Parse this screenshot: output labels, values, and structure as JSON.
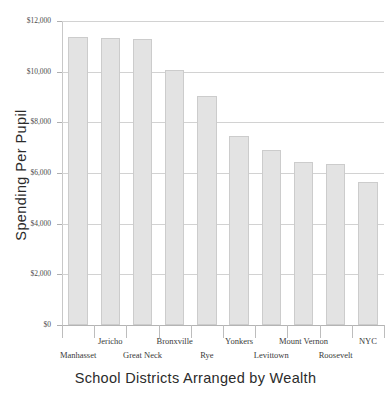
{
  "chart_data": {
    "type": "bar",
    "title": "",
    "xlabel": "School Districts Arranged by Wealth",
    "ylabel": "Spending Per Pupil",
    "categories": [
      "Manhasset",
      "Jericho",
      "Great Neck",
      "Bronxville",
      "Rye",
      "Yonkers",
      "Levittown",
      "Mount Vernon",
      "Roosevelt",
      "NYC"
    ],
    "values": [
      11350,
      11330,
      11300,
      10050,
      9050,
      7450,
      6900,
      6450,
      6350,
      5650
    ],
    "ylim": [
      0,
      12000
    ],
    "ytick_values": [
      0,
      2000,
      4000,
      6000,
      8000,
      10000,
      12000
    ],
    "ytick_labels": [
      "$0",
      "$2,000",
      "$4,000",
      "$6,000",
      "$8,000",
      "$10,000",
      "$12,000"
    ],
    "grid": true,
    "legend": "none",
    "bar_color": "#e3e3e3",
    "bar_border_color": "#cccccc",
    "gridline_color": "#d2d2d2",
    "text_color": "#3a3a3a"
  }
}
